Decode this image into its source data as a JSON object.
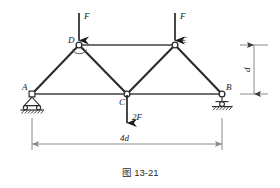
{
  "figure": {
    "caption_prefix": "图",
    "caption_number": "13-21",
    "caption_full": "图 13-21"
  },
  "diagram": {
    "type": "truss-free-body-diagram",
    "nodes": [
      {
        "id": "A",
        "label": "A",
        "x": 32,
        "y": 94,
        "support": "pin"
      },
      {
        "id": "B",
        "label": "B",
        "x": 222,
        "y": 94,
        "support": "roller"
      },
      {
        "id": "C",
        "label": "C",
        "x": 127,
        "y": 94,
        "support": "none"
      },
      {
        "id": "D",
        "label": "D",
        "x": 79,
        "y": 45,
        "support": "none"
      },
      {
        "id": "E",
        "label": "E",
        "x": 175,
        "y": 45,
        "support": "none"
      }
    ],
    "members": [
      {
        "from": "A",
        "to": "D"
      },
      {
        "from": "D",
        "to": "E"
      },
      {
        "from": "E",
        "to": "B"
      },
      {
        "from": "D",
        "to": "C"
      },
      {
        "from": "C",
        "to": "E"
      },
      {
        "from": "A",
        "to": "C"
      },
      {
        "from": "C",
        "to": "B"
      }
    ],
    "loads": [
      {
        "id": "load-D",
        "label": "F",
        "at": "D",
        "direction": "down"
      },
      {
        "id": "load-E",
        "label": "F",
        "at": "E",
        "direction": "down"
      },
      {
        "id": "load-C",
        "label": "2F",
        "at": "C",
        "direction": "down"
      }
    ],
    "dimensions": [
      {
        "id": "span",
        "label": "4d",
        "orientation": "horizontal"
      },
      {
        "id": "height",
        "label": "d",
        "orientation": "vertical"
      }
    ],
    "colors": {
      "member": "#2b2b2b",
      "chord": "#6f6f6f",
      "dimension": "#8a8a8a",
      "text": "#1a1a1a",
      "background": "#ffffff"
    }
  }
}
